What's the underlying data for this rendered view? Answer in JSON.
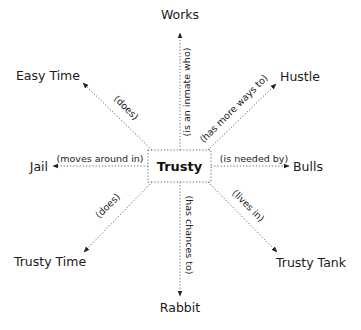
{
  "diagram": {
    "type": "concept-map",
    "center": {
      "label": "Trusty"
    },
    "nodes": [
      {
        "id": "works",
        "label": "Works",
        "relation": "(is an inmate who)"
      },
      {
        "id": "hustle",
        "label": "Hustle",
        "relation": "(has more ways to)"
      },
      {
        "id": "easy_time",
        "label": "Easy Time",
        "relation": "(does)"
      },
      {
        "id": "jail",
        "label": "Jail",
        "relation": "(moves around in)"
      },
      {
        "id": "bulls",
        "label": "Bulls",
        "relation": "(is needed by)"
      },
      {
        "id": "trusty_time",
        "label": "Trusty Time",
        "relation": "(does)"
      },
      {
        "id": "trusty_tank",
        "label": "Trusty Tank",
        "relation": "(lives in)"
      },
      {
        "id": "rabbit",
        "label": "Rabbit",
        "relation": "(has chances to)"
      }
    ]
  }
}
